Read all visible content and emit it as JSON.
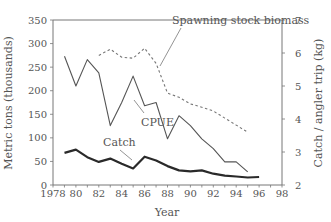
{
  "chart_data": {
    "type": "line",
    "title": "",
    "xlabel": "Year",
    "ylabel_left": "Metric tons (thousands)",
    "ylabel_right": "Catch / angler trip (kg)",
    "xlim": [
      1978,
      1998
    ],
    "ylim_left": [
      0,
      350
    ],
    "ylim_right": [
      2,
      7
    ],
    "x_ticks": [
      1978,
      1980,
      1982,
      1984,
      1986,
      1988,
      1990,
      1992,
      1994,
      1996,
      1998
    ],
    "x_tick_labels": [
      "1978",
      "80",
      "82",
      "84",
      "86",
      "88",
      "90",
      "92",
      "94",
      "96",
      "98"
    ],
    "y_left_ticks": [
      0,
      50,
      100,
      150,
      200,
      250,
      300,
      350
    ],
    "y_right_ticks": [
      2,
      3,
      4,
      5,
      6,
      7
    ],
    "grid": false,
    "legend": "inline annotations",
    "series": [
      {
        "name": "Spawning stock biomass",
        "axis": "left",
        "style": "dashed",
        "color": "#777777",
        "x": [
          1982,
          1983,
          1984,
          1985,
          1986,
          1987,
          1988,
          1989,
          1990,
          1991,
          1992,
          1993,
          1994,
          1995
        ],
        "values": [
          275,
          288,
          271,
          269,
          290,
          258,
          195,
          186,
          172,
          165,
          157,
          142,
          127,
          112
        ]
      },
      {
        "name": "CPUE",
        "axis": "right",
        "style": "solid-thin",
        "color": "#555555",
        "x": [
          1979,
          1980,
          1981,
          1982,
          1983,
          1984,
          1985,
          1986,
          1987,
          1988,
          1989,
          1990,
          1991,
          1992,
          1993,
          1994,
          1995
        ],
        "values": [
          5.9,
          5.0,
          5.8,
          5.4,
          3.8,
          4.5,
          5.3,
          4.4,
          4.5,
          3.4,
          4.1,
          3.8,
          3.4,
          3.1,
          2.7,
          2.7,
          2.4
        ]
      },
      {
        "name": "Catch",
        "axis": "left",
        "style": "solid-thick",
        "color": "#2a2a2a",
        "x": [
          1979,
          1980,
          1981,
          1982,
          1983,
          1984,
          1985,
          1986,
          1987,
          1988,
          1989,
          1990,
          1991,
          1992,
          1993,
          1994,
          1995,
          1996
        ],
        "values": [
          68,
          75,
          59,
          49,
          56,
          45,
          35,
          60,
          52,
          40,
          31,
          29,
          31,
          24,
          20,
          18,
          16,
          17
        ]
      }
    ],
    "annotations": [
      {
        "text": "Spawning stock biomass",
        "x_px": 172,
        "y_px": 24,
        "line": [
          [
            181,
            28
          ],
          [
            160,
            66
          ]
        ]
      },
      {
        "text": "CPUE",
        "x_px": 141,
        "y_px": 126,
        "line": [
          [
            144,
            113
          ],
          [
            134,
            100
          ]
        ]
      },
      {
        "text": "Catch",
        "x_px": 103,
        "y_px": 146,
        "line": [
          [
            120,
            150
          ],
          [
            132,
            160
          ]
        ]
      }
    ]
  }
}
